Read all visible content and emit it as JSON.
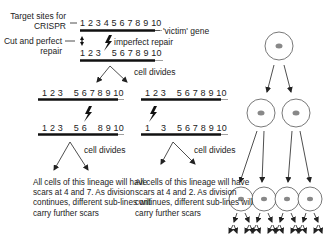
{
  "labels": {
    "target_sites": "Target sites for",
    "crispr": "CRISPR",
    "cut_perfect": "Cut and perfect",
    "repair": "repair",
    "imperfect_repair": "imperfect repair",
    "victim_gene": "'victim' gene",
    "cell_divides_1": "cell divides",
    "cell_divides_2": "cell divides",
    "cell_divides_3": "cell divides"
  },
  "sequences": {
    "original": "1 2 3 4 5 6 7 8 9 10",
    "after_repair": "1 2 3    5 6 7 8 9 10",
    "left_daughter": "1 2 3    5 6 7 8 9 10",
    "right_daughter": "1 2 3    5 6 7 8 9 10",
    "left_scarred": "1 2 3    5 6    8 9 10",
    "right_scarred": "1    3    5 6 7 8 9 10"
  },
  "notes": {
    "left": "All cells of this lineage will have scars at 4 and 7. As division continues, different sub-lines will carry further scars",
    "right": "All cells of this lineage will have scars at 4 and 2. As division continues, different sub-lines will carry further scars"
  },
  "tree": {
    "levels": [
      1,
      2,
      4
    ],
    "cell_outline": "#444444",
    "nucleus_color": "#888888"
  }
}
